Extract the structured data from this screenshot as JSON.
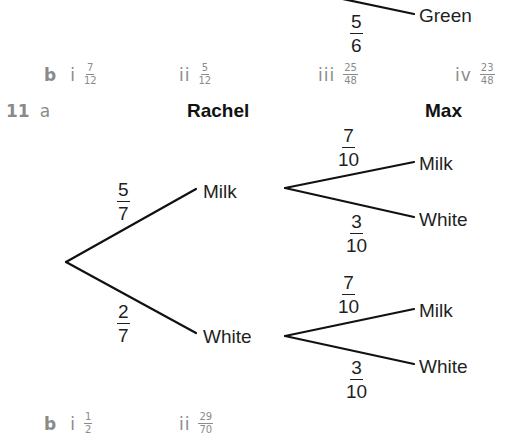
{
  "top_fragment": {
    "branch_label": "Green",
    "probability": {
      "num": "5",
      "den": "6"
    }
  },
  "answers_10b": {
    "part": "b",
    "items": [
      {
        "roman": "i",
        "num": "7",
        "den": "12"
      },
      {
        "roman": "ii",
        "num": "5",
        "den": "12"
      },
      {
        "roman": "iii",
        "num": "25",
        "den": "48"
      },
      {
        "roman": "iv",
        "num": "23",
        "den": "48"
      }
    ]
  },
  "question_11": {
    "number": "11",
    "part": "a",
    "headers": {
      "first": "Rachel",
      "second": "Max"
    },
    "tree": {
      "first_level": [
        {
          "label": "Milk",
          "prob": {
            "num": "5",
            "den": "7"
          }
        },
        {
          "label": "White",
          "prob": {
            "num": "2",
            "den": "7"
          }
        }
      ],
      "second_level_from_milk": [
        {
          "label": "Milk",
          "prob": {
            "num": "7",
            "den": "10"
          }
        },
        {
          "label": "White",
          "prob": {
            "num": "3",
            "den": "10"
          }
        }
      ],
      "second_level_from_white": [
        {
          "label": "Milk",
          "prob": {
            "num": "7",
            "den": "10"
          }
        },
        {
          "label": "White",
          "prob": {
            "num": "3",
            "den": "10"
          }
        }
      ]
    }
  },
  "answers_11b": {
    "part": "b",
    "items": [
      {
        "roman": "i",
        "num": "1",
        "den": "2"
      },
      {
        "roman": "ii",
        "num": "29",
        "den": "70"
      }
    ]
  }
}
